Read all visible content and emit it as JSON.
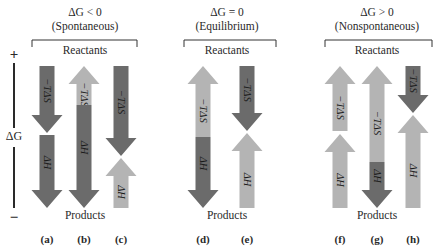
{
  "colors": {
    "dark": "#6b6b6b",
    "light": "#b4b4b4",
    "text": "#2a2a2a",
    "bracket": "#333333",
    "background": "#ffffff"
  },
  "axis": {
    "label": "ΔG",
    "plus": "+",
    "minus": "−",
    "x": 14,
    "top": 62,
    "bottom": 208
  },
  "groups": [
    {
      "id": "spontaneous",
      "condition": "ΔG < 0",
      "description": "(Spontaneous)",
      "reactants_label": "Reactants",
      "products_label": "Products",
      "center_x": 85,
      "bracket_x1": 32,
      "bracket_x2": 137
    },
    {
      "id": "equilibrium",
      "condition": "ΔG = 0",
      "description": "(Equilibrium)",
      "reactants_label": "Reactants",
      "products_label": "Products",
      "center_x": 227,
      "bracket_x1": 184,
      "bracket_x2": 276
    },
    {
      "id": "nonspontaneous",
      "condition": "ΔG > 0",
      "description": "(Nonspontaneous)",
      "reactants_label": "Reactants",
      "products_label": "Products",
      "center_x": 377,
      "bracket_x1": 325,
      "bracket_x2": 432
    }
  ],
  "columns": [
    {
      "letter": "(a)",
      "x": 47,
      "segments": [
        {
          "label": "−TΔS",
          "shade": "dark",
          "dir": "down",
          "y1": 66,
          "y2": 133
        },
        {
          "label": "ΔH",
          "shade": "dark",
          "dir": "down",
          "y1": 135,
          "y2": 208
        }
      ]
    },
    {
      "letter": "(b)",
      "x": 84,
      "segments": [
        {
          "label": "−TΔS",
          "shade": "light",
          "dir": "up",
          "y1": 66,
          "y2": 105
        },
        {
          "label": "ΔH",
          "shade": "dark",
          "dir": "down",
          "y1": 105,
          "y2": 208
        }
      ]
    },
    {
      "letter": "(c)",
      "x": 121,
      "segments": [
        {
          "label": "−TΔS",
          "shade": "dark",
          "dir": "down",
          "y1": 66,
          "y2": 156
        },
        {
          "label": "ΔH",
          "shade": "light",
          "dir": "up",
          "y1": 158,
          "y2": 208
        }
      ]
    },
    {
      "letter": "(d)",
      "x": 203,
      "segments": [
        {
          "label": "−TΔS",
          "shade": "light",
          "dir": "up",
          "y1": 66,
          "y2": 137
        },
        {
          "label": "ΔH",
          "shade": "dark",
          "dir": "down",
          "y1": 137,
          "y2": 208
        }
      ]
    },
    {
      "letter": "(e)",
      "x": 247,
      "segments": [
        {
          "label": "−TΔS",
          "shade": "dark",
          "dir": "down",
          "y1": 66,
          "y2": 131
        },
        {
          "label": "ΔH",
          "shade": "light",
          "dir": "up",
          "y1": 133,
          "y2": 208
        }
      ]
    },
    {
      "letter": "(f)",
      "x": 340,
      "segments": [
        {
          "label": "−TΔS",
          "shade": "light",
          "dir": "up",
          "y1": 66,
          "y2": 131
        },
        {
          "label": "ΔH",
          "shade": "light",
          "dir": "up",
          "y1": 134,
          "y2": 208
        }
      ]
    },
    {
      "letter": "(g)",
      "x": 377,
      "segments": [
        {
          "label": "−TΔS",
          "shade": "light",
          "dir": "up",
          "y1": 66,
          "y2": 162
        },
        {
          "label": "ΔH",
          "shade": "dark",
          "dir": "down",
          "y1": 162,
          "y2": 208
        }
      ]
    },
    {
      "letter": "(h)",
      "x": 413,
      "segments": [
        {
          "label": "−TΔS",
          "shade": "dark",
          "dir": "down",
          "y1": 66,
          "y2": 113
        },
        {
          "label": "ΔH",
          "shade": "light",
          "dir": "up",
          "y1": 115,
          "y2": 208
        }
      ]
    }
  ],
  "layout": {
    "shaft_width": 15,
    "head_width": 31,
    "head_length": 18,
    "condition_y": 16,
    "description_y": 30,
    "bracket_y": 40,
    "bracket_tick": 7,
    "reactants_y": 54,
    "products_y": 219,
    "letter_y": 243
  }
}
